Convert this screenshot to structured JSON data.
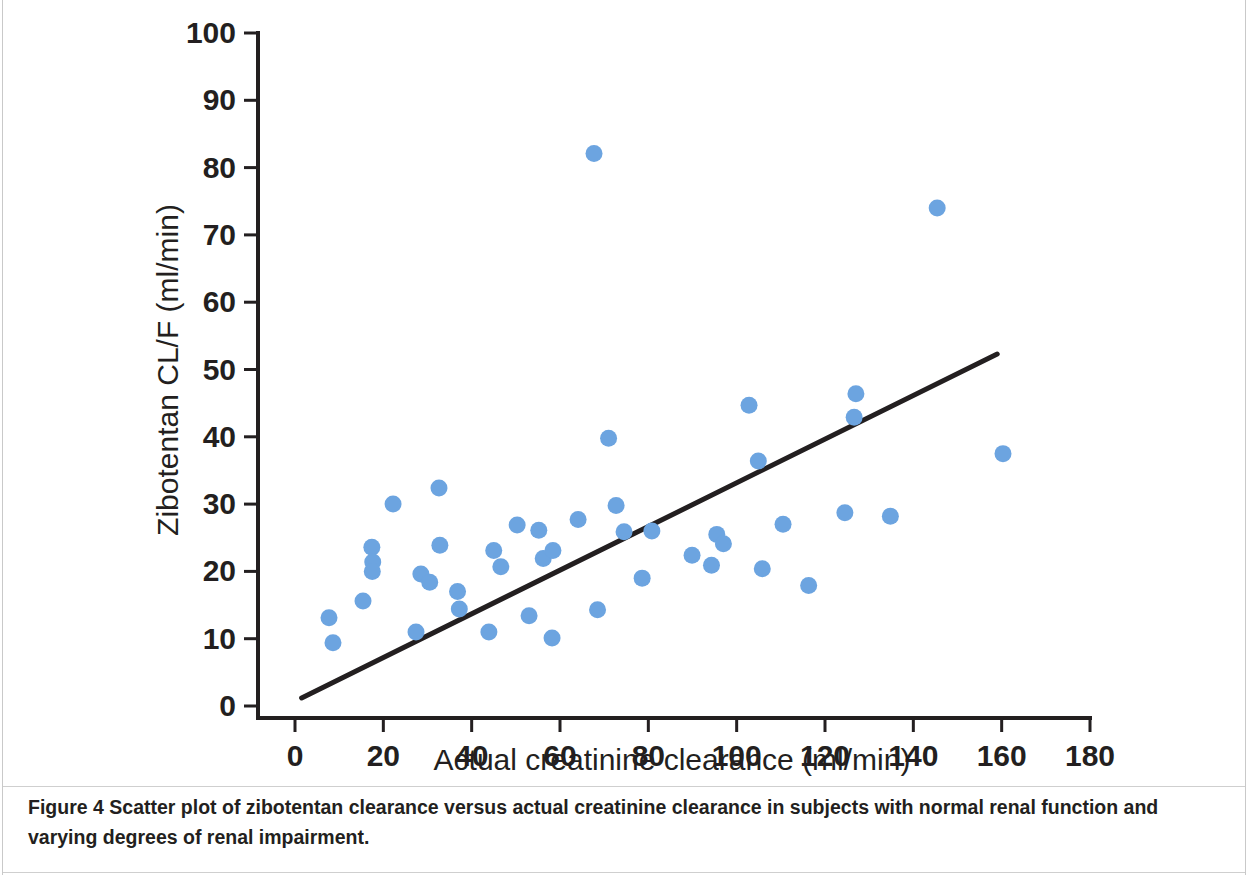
{
  "figure": {
    "caption_label": "Figure 4",
    "caption_text": "Scatter plot of zibotentan clearance versus actual creatinine clearance in subjects with normal renal function and varying degrees of renal impairment."
  },
  "chart_data": {
    "type": "scatter",
    "title": "",
    "xlabel": "Actual creatinine clearance (ml/min)",
    "ylabel": "Zibotentan CL/F (ml/min)",
    "xlim": [
      0,
      180
    ],
    "ylim": [
      0,
      100
    ],
    "xticks": [
      0,
      20,
      40,
      60,
      80,
      100,
      120,
      140,
      160,
      180
    ],
    "yticks": [
      0,
      10,
      20,
      30,
      40,
      50,
      60,
      70,
      80,
      90,
      100
    ],
    "grid": false,
    "legend": false,
    "marker_color": "#6ca4e0",
    "line_color": "#231f20",
    "series": [
      {
        "name": "Subjects",
        "points": [
          [
            7.7,
            13.1
          ],
          [
            8.6,
            9.4
          ],
          [
            15.4,
            15.6
          ],
          [
            17.4,
            23.6
          ],
          [
            17.6,
            21.4
          ],
          [
            17.5,
            20.0
          ],
          [
            22.2,
            30.0
          ],
          [
            27.4,
            11.0
          ],
          [
            28.5,
            19.6
          ],
          [
            30.5,
            18.4
          ],
          [
            32.6,
            32.4
          ],
          [
            32.8,
            23.9
          ],
          [
            36.8,
            17.0
          ],
          [
            37.2,
            14.4
          ],
          [
            43.9,
            11.0
          ],
          [
            45.0,
            23.1
          ],
          [
            46.6,
            20.7
          ],
          [
            50.3,
            26.9
          ],
          [
            53.0,
            13.4
          ],
          [
            55.2,
            26.1
          ],
          [
            56.2,
            21.9
          ],
          [
            58.4,
            23.1
          ],
          [
            58.2,
            10.1
          ],
          [
            64.1,
            27.7
          ],
          [
            67.7,
            82.1
          ],
          [
            68.5,
            14.3
          ],
          [
            71.0,
            39.8
          ],
          [
            72.7,
            29.8
          ],
          [
            74.5,
            25.9
          ],
          [
            78.6,
            19.0
          ],
          [
            80.8,
            26.0
          ],
          [
            89.9,
            22.4
          ],
          [
            94.3,
            20.9
          ],
          [
            95.5,
            25.5
          ],
          [
            97.0,
            24.1
          ],
          [
            102.8,
            44.7
          ],
          [
            104.9,
            36.4
          ],
          [
            105.8,
            20.4
          ],
          [
            110.5,
            27.0
          ],
          [
            116.3,
            17.9
          ],
          [
            124.5,
            28.7
          ],
          [
            126.6,
            42.9
          ],
          [
            127.0,
            46.4
          ],
          [
            134.8,
            28.2
          ],
          [
            145.4,
            74.0
          ],
          [
            160.3,
            37.5
          ]
        ]
      }
    ],
    "fit_line": {
      "name": "Linear regression line",
      "x_start": 1.5,
      "y_start": 1.2,
      "x_end": 159.0,
      "y_end": 52.3
    }
  }
}
